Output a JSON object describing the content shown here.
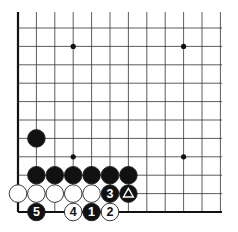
{
  "diagram": {
    "grid": {
      "origin_x": 18,
      "origin_y": 212,
      "spacing_x": 18.4,
      "spacing_y": 18.4,
      "cols": 12,
      "rows": 12,
      "top_y": 12,
      "right_x": 222,
      "line_color": "#333333",
      "edge_color": "#111111"
    },
    "star_points": [
      {
        "col": 3,
        "row": 9
      },
      {
        "col": 9,
        "row": 9
      },
      {
        "col": 3,
        "row": 3
      },
      {
        "col": 9,
        "row": 3
      }
    ],
    "stones": [
      {
        "color": "black",
        "col": 1,
        "row": 4,
        "label": ""
      },
      {
        "color": "black",
        "col": 1,
        "row": 2,
        "label": ""
      },
      {
        "color": "black",
        "col": 2,
        "row": 2,
        "label": ""
      },
      {
        "color": "black",
        "col": 3,
        "row": 2,
        "label": ""
      },
      {
        "color": "black",
        "col": 4,
        "row": 2,
        "label": ""
      },
      {
        "color": "black",
        "col": 5,
        "row": 2,
        "label": ""
      },
      {
        "color": "black",
        "col": 6,
        "row": 2,
        "label": ""
      },
      {
        "color": "white",
        "col": 0,
        "row": 1,
        "label": ""
      },
      {
        "color": "white",
        "col": 1,
        "row": 1,
        "label": ""
      },
      {
        "color": "white",
        "col": 2,
        "row": 1,
        "label": ""
      },
      {
        "color": "white",
        "col": 3,
        "row": 1,
        "label": ""
      },
      {
        "color": "white",
        "col": 4,
        "row": 1,
        "label": ""
      },
      {
        "color": "black",
        "col": 5,
        "row": 1,
        "label": "3"
      },
      {
        "color": "black",
        "col": 6,
        "row": 1,
        "label": "triangle"
      },
      {
        "color": "black",
        "col": 1,
        "row": 0,
        "label": "5"
      },
      {
        "color": "white",
        "col": 3,
        "row": 0,
        "label": "4"
      },
      {
        "color": "black",
        "col": 4,
        "row": 0,
        "label": "1"
      },
      {
        "color": "white",
        "col": 5,
        "row": 0,
        "label": "2"
      }
    ],
    "colors": {
      "black_stone": "#111111",
      "white_stone": "#ffffff",
      "stone_outline": "#222222",
      "board_bg": "#ffffff"
    }
  }
}
